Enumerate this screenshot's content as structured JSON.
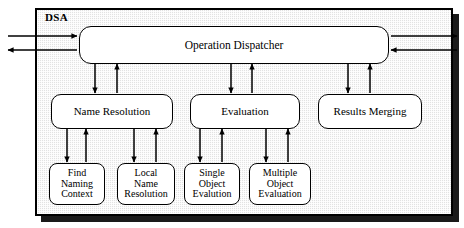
{
  "diagram": {
    "title": "DSA",
    "frame_label": "DSA",
    "background_color": "#e2e2e2",
    "line_color": "#000000",
    "node_fill": "#ffffff"
  },
  "nodes": {
    "dispatcher": {
      "label": "Operation Dispatcher"
    },
    "name_resolution": {
      "label": "Name Resolution"
    },
    "evaluation": {
      "label": "Evaluation"
    },
    "results_merging": {
      "label": "Results Merging"
    },
    "find_naming_context": {
      "label": "Find\nNaming\nContext"
    },
    "local_name_resolution": {
      "label": "Local\nName\nResolution"
    },
    "single_object_evaluation": {
      "label": "Single\nObject\nEvalution"
    },
    "multiple_object_evaluation": {
      "label": "Multiple\nObject\nEvaluation"
    }
  },
  "external_ports": {
    "left_inbound": "arrow-into-dispatcher-from-left",
    "left_outbound": "arrow-out-of-dispatcher-to-left",
    "right_outbound": "arrow-out-of-dispatcher-to-right",
    "right_inbound": "arrow-into-dispatcher-from-right"
  },
  "connections": [
    {
      "from": "dispatcher",
      "to": "name_resolution",
      "direction": "down"
    },
    {
      "from": "name_resolution",
      "to": "dispatcher",
      "direction": "up"
    },
    {
      "from": "dispatcher",
      "to": "evaluation",
      "direction": "down"
    },
    {
      "from": "evaluation",
      "to": "dispatcher",
      "direction": "up"
    },
    {
      "from": "dispatcher",
      "to": "results_merging",
      "direction": "down"
    },
    {
      "from": "results_merging",
      "to": "dispatcher",
      "direction": "up"
    },
    {
      "from": "name_resolution",
      "to": "find_naming_context",
      "direction": "down"
    },
    {
      "from": "find_naming_context",
      "to": "name_resolution",
      "direction": "up"
    },
    {
      "from": "name_resolution",
      "to": "local_name_resolution",
      "direction": "down"
    },
    {
      "from": "local_name_resolution",
      "to": "name_resolution",
      "direction": "up"
    },
    {
      "from": "evaluation",
      "to": "single_object_evaluation",
      "direction": "down"
    },
    {
      "from": "single_object_evaluation",
      "to": "evaluation",
      "direction": "up"
    },
    {
      "from": "evaluation",
      "to": "multiple_object_evaluation",
      "direction": "down"
    },
    {
      "from": "multiple_object_evaluation",
      "to": "evaluation",
      "direction": "up"
    }
  ]
}
